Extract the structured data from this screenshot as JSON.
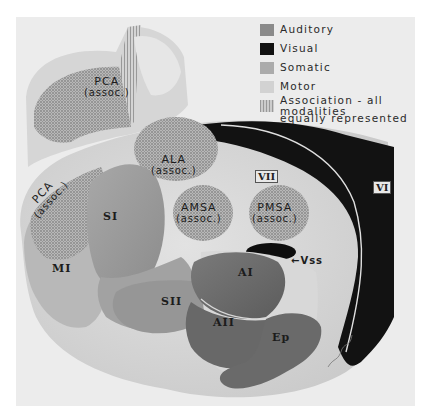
{
  "legend": {
    "items": [
      {
        "label": "Auditory",
        "color": "#8a8a8a",
        "pattern": "solid"
      },
      {
        "label": "Visual",
        "color": "#111111",
        "pattern": "solid"
      },
      {
        "label": "Somatic",
        "color": "#ababab",
        "pattern": "solid"
      },
      {
        "label": "Motor",
        "color": "#cfcfcf",
        "pattern": "solid"
      },
      {
        "label": "Association - all modalities",
        "label_line2": "equally represented",
        "color": "#a0a0a0",
        "pattern": "stipple"
      }
    ]
  },
  "inset": {
    "area": {
      "name": "PCA",
      "sub": "(assoc.)"
    }
  },
  "main": {
    "areas": {
      "pca": {
        "name": "PCA",
        "sub": "(assoc.)"
      },
      "ala": {
        "name": "ALA",
        "sub": "(assoc.)"
      },
      "amsa": {
        "name": "AMSA",
        "sub": "(assoc.)"
      },
      "pmsa": {
        "name": "PMSA",
        "sub": "(assoc.)"
      },
      "si": {
        "name": "SI"
      },
      "sii": {
        "name": "SII"
      },
      "mi": {
        "name": "MI"
      },
      "ai": {
        "name": "AI"
      },
      "aii": {
        "name": "AII"
      },
      "ep": {
        "name": "Ep"
      },
      "vss": {
        "name": "Vss"
      },
      "vi": {
        "name": "VI"
      },
      "vii": {
        "name": "VII"
      }
    }
  },
  "colors": {
    "background": "#ececec",
    "brain": "#dcdcdc",
    "auditory": "#6e6e6e",
    "visual": "#111111",
    "somatic": "#9c9c9c",
    "motor": "#c4c4c4",
    "association": "#a8a8a8"
  }
}
